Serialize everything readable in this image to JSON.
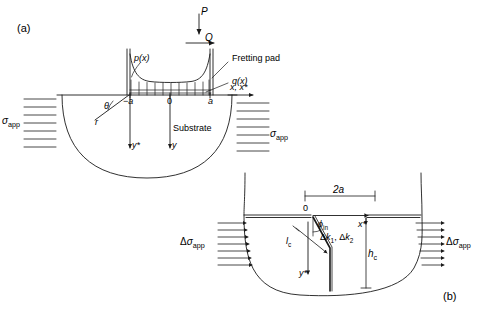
{
  "figure": {
    "panel_a": {
      "tag": "(a)",
      "load_normal": "P",
      "load_tangential": "Q",
      "pressure_label": "p(x)",
      "shear_label": "q(x)",
      "pad_label": "Fretting pad",
      "substrate_label": "Substrate",
      "contact_left": "−a",
      "contact_origin": "0",
      "contact_right": "a",
      "axis_x": "x, x*",
      "axis_y": "y",
      "axis_y_star": "y*",
      "polar_angle": "θ",
      "polar_radius": "r",
      "stress_left": "σapp",
      "stress_right": "σapp",
      "stress_left_symbol": "σ",
      "stress_left_sub": "app",
      "hatch_count_left": 7,
      "hatch_count_right": 7,
      "traction_ticks": 11
    },
    "panel_b": {
      "tag": "(b)",
      "contact_width": "2a",
      "origin": "0",
      "axis_x_star": "x*",
      "axis_y_star": "y*",
      "crack_angle": "ϕin",
      "crack_angle_symbol": "ϕ",
      "crack_angle_sub": "in",
      "sif_label": "Δk1, Δk2",
      "crack_length": "lc",
      "crack_length_symbol": "l",
      "crack_length_sub": "c",
      "depth_label": "hc",
      "depth_symbol": "h",
      "depth_sub": "c",
      "stress_left": "Δσapp",
      "stress_right": "Δσapp",
      "stress_symbol": "Δσ",
      "stress_sub": "app",
      "hatch_count_left": 7,
      "hatch_count_right": 7
    },
    "colors": {
      "line": "#1a1a1a",
      "background": "#ffffff",
      "text": "#111111"
    }
  }
}
